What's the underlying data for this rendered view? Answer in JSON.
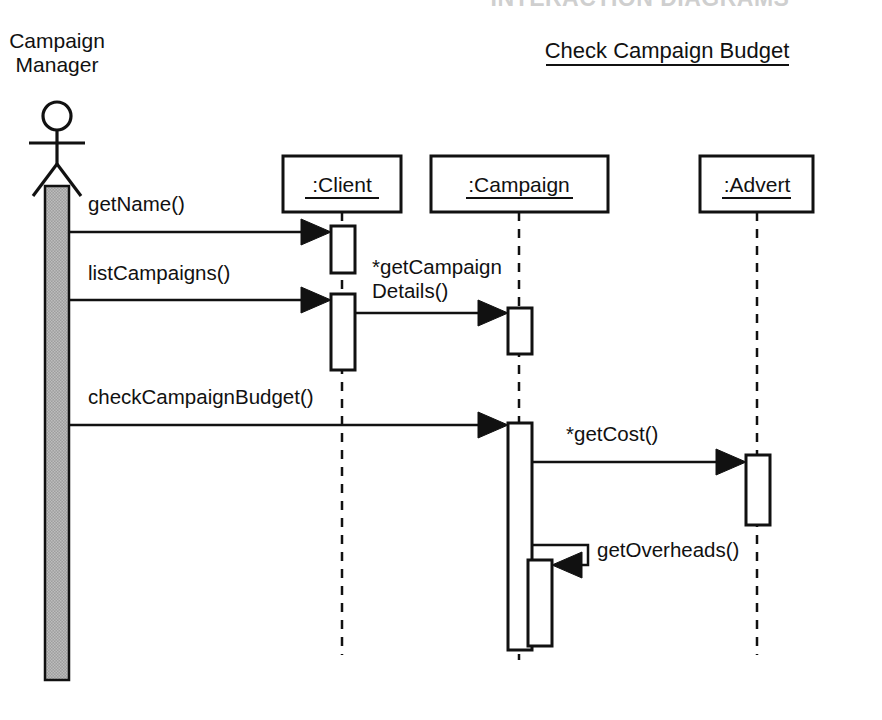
{
  "diagram": {
    "kind": "uml-sequence-diagram",
    "top_title_partial": "INTERACTION DIAGRAMS",
    "title": "Check Campaign Budget",
    "background_color": "#ffffff",
    "line_color": "#111111",
    "actor_activation_fill": "#a8a8a8"
  },
  "actor": {
    "name_line1": "Campaign",
    "name_line2": "Manager",
    "icon": "actor-stick-figure"
  },
  "objects": [
    {
      "id": "client",
      "label": ":Client"
    },
    {
      "id": "campaign",
      "label": ":Campaign"
    },
    {
      "id": "advert",
      "label": ":Advert"
    }
  ],
  "messages": [
    {
      "id": "m1",
      "label": "getName()",
      "from": "actor",
      "to": "client"
    },
    {
      "id": "m2",
      "label": "listCampaigns()",
      "from": "actor",
      "to": "client"
    },
    {
      "id": "m3",
      "label_line1": "*getCampaign",
      "label_line2": "Details()",
      "from": "client",
      "to": "campaign"
    },
    {
      "id": "m4",
      "label": "checkCampaignBudget()",
      "from": "actor",
      "to": "campaign"
    },
    {
      "id": "m5",
      "label": "*getCost()",
      "from": "campaign",
      "to": "advert"
    },
    {
      "id": "m6",
      "label": "getOverheads()",
      "from": "campaign",
      "to": "campaign"
    }
  ]
}
